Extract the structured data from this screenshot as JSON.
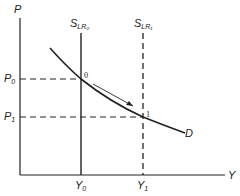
{
  "diagram": {
    "type": "supply-demand",
    "axes": {
      "y_label": "P",
      "x_label": "Y"
    },
    "price_levels": [
      {
        "label": "P",
        "sub": "0"
      },
      {
        "label": "P",
        "sub": "1"
      }
    ],
    "output_levels": [
      {
        "label": "Y",
        "sub": "0"
      },
      {
        "label": "Y",
        "sub": "1"
      }
    ],
    "supply_curves": [
      {
        "label": "S",
        "sub": "LR₀",
        "style": "solid"
      },
      {
        "label": "S",
        "sub": "LR₁",
        "style": "dashed"
      }
    ],
    "demand_curve": {
      "label": "D"
    },
    "equilibrium_points": [
      "0",
      "1"
    ],
    "arrow": "movement along D from point 0 to point 1",
    "colors": {
      "line": "#222222",
      "background": "#ffffff"
    }
  }
}
